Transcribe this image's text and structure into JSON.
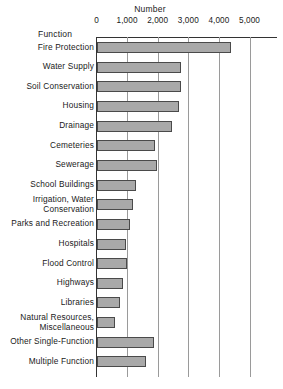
{
  "chart_data": {
    "type": "bar",
    "orientation": "horizontal",
    "title": "Number",
    "xlabel": "Number",
    "ylabel": "Function",
    "xlim": [
      0,
      5000
    ],
    "xticks": [
      "0",
      "1,000",
      "2,000",
      "3,000",
      "4,000",
      "5,000"
    ],
    "xtick_values": [
      0,
      1000,
      2000,
      3000,
      4000,
      5000
    ],
    "grid": true,
    "legend": "none",
    "bar_color": "#a9a9a9",
    "bar_edge_color": "#4a4a4a",
    "axis_color": "#333333",
    "grid_color": "#9a9a9a",
    "categories": [
      "Fire Protection",
      "Water Supply",
      "Soil Conservation",
      "Housing",
      "Drainage",
      "Cemeteries",
      "Sewerage",
      "School Buildings",
      "Irrigation, Water Conservation",
      "Parks and Recreation",
      "Hospitals",
      "Flood Control",
      "Highways",
      "Libraries",
      "Natural Resources, Miscellaneous",
      "Other Single-Function",
      "Multiple Function"
    ],
    "values": [
      4400,
      2750,
      2750,
      2700,
      2470,
      1900,
      1980,
      1300,
      1180,
      1100,
      960,
      1000,
      850,
      780,
      610,
      1870,
      1630
    ]
  },
  "labels": {
    "axis_title": "Number",
    "function_header": "Function",
    "rows": [
      {
        "line1": "Fire Protection",
        "line2": ""
      },
      {
        "line1": "Water Supply",
        "line2": ""
      },
      {
        "line1": "Soil Conservation",
        "line2": ""
      },
      {
        "line1": "Housing",
        "line2": ""
      },
      {
        "line1": "Drainage",
        "line2": ""
      },
      {
        "line1": "Cemeteries",
        "line2": ""
      },
      {
        "line1": "Sewerage",
        "line2": ""
      },
      {
        "line1": "School Buildings",
        "line2": ""
      },
      {
        "line1": "Irrigation, Water",
        "line2": "Conservation"
      },
      {
        "line1": "Parks and Recreation",
        "line2": ""
      },
      {
        "line1": "Hospitals",
        "line2": ""
      },
      {
        "line1": "Flood Control",
        "line2": ""
      },
      {
        "line1": "Highways",
        "line2": ""
      },
      {
        "line1": "Libraries",
        "line2": ""
      },
      {
        "line1": "Natural Resources,",
        "line2": "Miscellaneous"
      },
      {
        "line1": "Other Single-Function",
        "line2": ""
      },
      {
        "line1": "Multiple Function",
        "line2": ""
      }
    ]
  }
}
